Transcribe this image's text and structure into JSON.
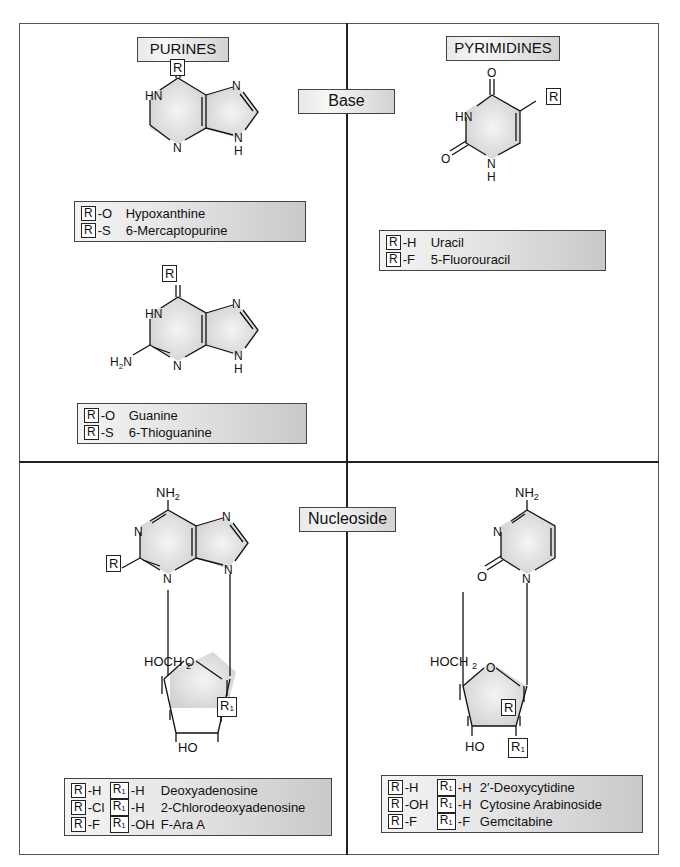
{
  "sections": {
    "purines_title": "PURINES",
    "pyrimidines_title": "PYRIMIDINES",
    "base_label": "Base",
    "nucleoside_label": "Nucleoside"
  },
  "structures": {
    "purine_1": {
      "substituent": "R",
      "atoms": [
        "HN",
        "N",
        "N",
        "N",
        "H"
      ]
    },
    "purine_2": {
      "substituent": "R",
      "atoms": [
        "HN",
        "N",
        "N",
        "N",
        "H",
        "H2N"
      ]
    },
    "pyrimidine": {
      "substituent": "R",
      "atoms": [
        "O",
        "HN",
        "O",
        "N",
        "H"
      ]
    },
    "purine_nucleoside": {
      "substituents": [
        "R",
        "R1"
      ],
      "atoms": [
        "NH2",
        "N",
        "N",
        "N",
        "N",
        "HOCH2",
        "O",
        "HO"
      ]
    },
    "pyrimidine_nucleoside": {
      "substituents": [
        "R",
        "R1"
      ],
      "atoms": [
        "NH2",
        "N",
        "O",
        "N",
        "HOCH2",
        "O",
        "HO"
      ]
    }
  },
  "legends": {
    "hypoxanthine_box": [
      {
        "r": "R",
        "group": "-O",
        "name": "Hypoxanthine"
      },
      {
        "r": "R",
        "group": "-S",
        "name": "6-Mercaptopurine"
      }
    ],
    "guanine_box": [
      {
        "r": "R",
        "group": "-O",
        "name": "Guanine"
      },
      {
        "r": "R",
        "group": "-S",
        "name": "6-Thioguanine"
      }
    ],
    "uracil_box": [
      {
        "r": "R",
        "group": "-H",
        "name": "Uracil"
      },
      {
        "r": "R",
        "group": "-F",
        "name": "5-Fluorouracil"
      }
    ],
    "adenosine_box": [
      {
        "r": "R",
        "r_group": "-H",
        "r1": "R1",
        "r1_group": "-H",
        "name": "Deoxyadenosine"
      },
      {
        "r": "R",
        "r_group": "-Cl",
        "r1": "R1",
        "r1_group": "-H",
        "name": "2-Chlorodeoxyadenosine"
      },
      {
        "r": "R",
        "r_group": "-F",
        "r1": "R1",
        "r1_group": "-OH",
        "name": "F-Ara A"
      }
    ],
    "cytidine_box": [
      {
        "r": "R",
        "r_group": "-H",
        "r1": "R1",
        "r1_group": "-H",
        "name": "2′-Deoxycytidine"
      },
      {
        "r": "R",
        "r_group": "-OH",
        "r1": "R1",
        "r1_group": "-H",
        "name": "Cytosine Arabinoside"
      },
      {
        "r": "R",
        "r_group": "-F",
        "r1": "R1",
        "r1_group": "-F",
        "name": "Gemcitabine"
      }
    ]
  }
}
